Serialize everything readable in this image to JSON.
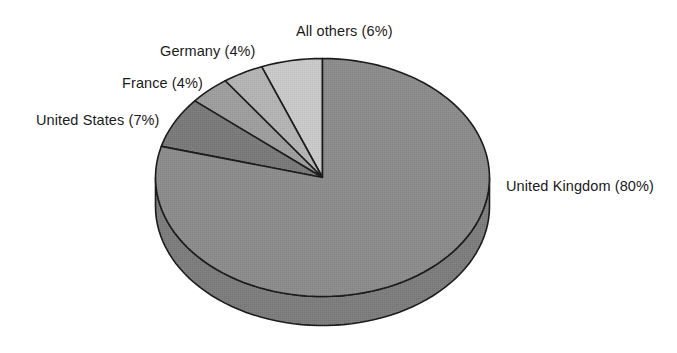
{
  "chart_data": {
    "type": "pie",
    "title": "",
    "subtitle": "",
    "xlabel": "",
    "ylabel": "",
    "legend_position": "none",
    "grid": false,
    "start_angle_deg": 90,
    "direction": "counterclockwise",
    "three_d": true,
    "categories": [
      "All others",
      "Germany",
      "France",
      "United States",
      "United Kingdom"
    ],
    "values": [
      6,
      4,
      4,
      7,
      80
    ],
    "unit": "%",
    "slices": [
      {
        "name": "all-others",
        "label": "All others (6%)",
        "category": "All others",
        "value": 6,
        "color": "#c9c9c9",
        "side_color": "#c9c9c9"
      },
      {
        "name": "germany",
        "label": "Germany (4%)",
        "category": "Germany",
        "value": 4,
        "color": "#b4b4b4",
        "side_color": "#b4b4b4"
      },
      {
        "name": "france",
        "label": "France (4%)",
        "category": "France",
        "value": 4,
        "color": "#9e9e9e",
        "side_color": "#9e9e9e"
      },
      {
        "name": "united-states",
        "label": "United States (7%)",
        "category": "United States",
        "value": 7,
        "color": "#7a7a7a",
        "side_color": "#686868"
      },
      {
        "name": "united-kingdom",
        "label": "United Kingdom (80%)",
        "category": "United Kingdom",
        "value": 80,
        "color": "#8c8c8c",
        "side_color": "#7d7d7d"
      }
    ]
  },
  "labels": {
    "all_others": "All others (6%)",
    "germany": "Germany (4%)",
    "france": "France (4%)",
    "united_states": "United States (7%)",
    "united_kingdom": "United Kingdom (80%)"
  },
  "colors": {
    "background": "#ffffff",
    "outline": "#1a1a1a",
    "text": "#1a1a1a"
  }
}
